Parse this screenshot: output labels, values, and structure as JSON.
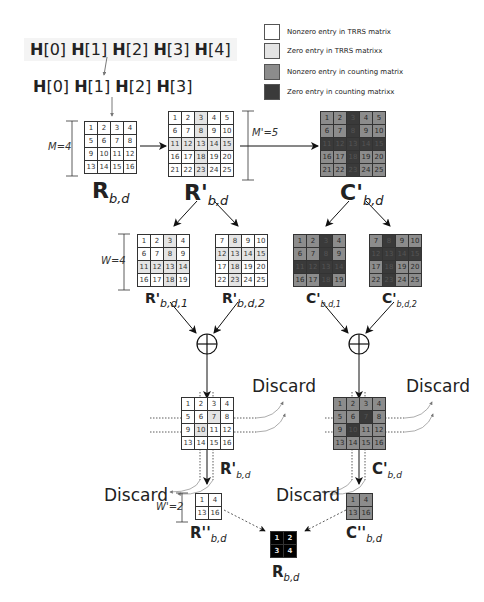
{
  "legend": {
    "items": [
      {
        "label": "Nonzero entry in TRRS matrix",
        "color": "#ffffff"
      },
      {
        "label": "Zero entry in TRRS matrixx",
        "color": "#e4e4e4"
      },
      {
        "label": "Nonzero entry in counting matrix",
        "color": "#8c8c8c"
      },
      {
        "label": "Zero entry in counting matrixx",
        "color": "#3a3a3a"
      }
    ]
  },
  "sequence_top": [
    "H",
    "[0] ",
    "H",
    "[1] ",
    "H",
    "[2] ",
    "H",
    "[3] ",
    "H",
    "[4]"
  ],
  "sequence_second": [
    "H",
    "[0] ",
    "H",
    "[1] ",
    "H",
    "[2] ",
    "H",
    "[3]"
  ],
  "labels": {
    "M": "M=4",
    "M_prime": "M'=5",
    "W": "W=4",
    "W_prime": "W'=2",
    "discard": "Discard",
    "R_main": "R",
    "R_main_sub": "b,d",
    "R_prime": "R'",
    "R_prime_sub": "b,d",
    "C_prime": "C'",
    "C_prime_sub": "b,d",
    "R_prime_1": "R'",
    "R_prime_1_sub": "b,d,1",
    "R_prime_2": "R'",
    "R_prime_2_sub": "b,d,2",
    "C_prime_1": "C'",
    "C_prime_1_sub": "b,d,1",
    "C_prime_2": "C'",
    "C_prime_2_sub": "b,d,2",
    "R_dprime": "R''",
    "R_dprime_sub": "b,d",
    "C_dprime": "C''",
    "C_dprime_sub": "b,d",
    "R_final": "R",
    "R_final_sub": "b,d",
    "oplus": "⊕"
  },
  "matrices": {
    "R": [
      [
        1,
        2,
        3,
        4
      ],
      [
        5,
        6,
        7,
        8
      ],
      [
        9,
        10,
        11,
        12
      ],
      [
        13,
        14,
        15,
        16
      ]
    ],
    "R_prime": [
      [
        1,
        2,
        3,
        4,
        5
      ],
      [
        6,
        7,
        8,
        9,
        10
      ],
      [
        11,
        12,
        13,
        14,
        15
      ],
      [
        16,
        17,
        18,
        19,
        20
      ],
      [
        21,
        22,
        23,
        24,
        25
      ]
    ],
    "R_prime_1": [
      [
        1,
        2,
        3,
        4
      ],
      [
        6,
        7,
        8,
        9
      ],
      [
        11,
        12,
        13,
        14
      ],
      [
        16,
        17,
        18,
        19
      ]
    ],
    "R_prime_2": [
      [
        7,
        8,
        9,
        10
      ],
      [
        12,
        13,
        14,
        15
      ],
      [
        17,
        18,
        19,
        20
      ],
      [
        22,
        23,
        24,
        25
      ]
    ],
    "R_sum": [
      [
        1,
        2,
        3,
        4
      ],
      [
        5,
        6,
        7,
        8
      ],
      [
        9,
        10,
        11,
        12
      ],
      [
        13,
        14,
        15,
        16
      ]
    ],
    "R_dprime": [
      [
        1,
        4
      ],
      [
        13,
        16
      ]
    ],
    "C_dprime": [
      [
        1,
        4
      ],
      [
        13,
        16
      ]
    ],
    "R_final": [
      [
        1,
        2
      ],
      [
        3,
        4
      ]
    ]
  }
}
